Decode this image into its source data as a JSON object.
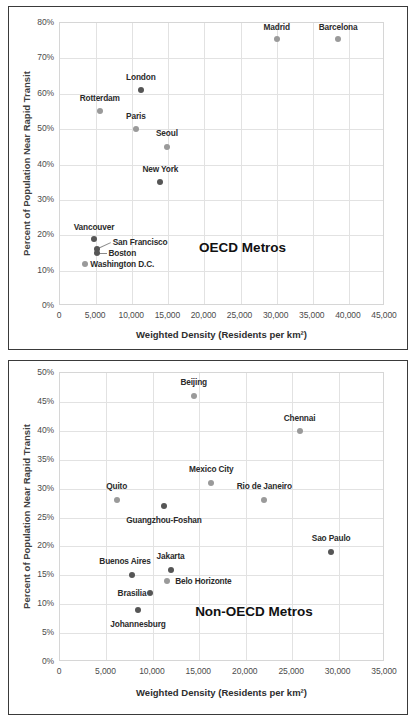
{
  "chart_data": [
    {
      "type": "scatter",
      "title": "OECD Metros",
      "annotation": "OECD Metros",
      "xlabel": "Weighted Density (Residents per km²)",
      "ylabel": "Percent of Population Near Rapid Transit",
      "xlim": [
        0,
        45000
      ],
      "ylim": [
        0,
        0.8
      ],
      "xticks": [
        "0",
        "5,000",
        "10,000",
        "15,000",
        "20,000",
        "25,000",
        "30,000",
        "35,000",
        "40,000",
        "45,000"
      ],
      "xtickvals": [
        0,
        5000,
        10000,
        15000,
        20000,
        25000,
        30000,
        35000,
        40000,
        45000
      ],
      "yticks": [
        "0%",
        "10%",
        "20%",
        "30%",
        "40%",
        "50%",
        "60%",
        "70%",
        "80%"
      ],
      "ytickvals": [
        0,
        10,
        20,
        30,
        40,
        50,
        60,
        70,
        80
      ],
      "grid": true,
      "legend": "none",
      "points": [
        {
          "name": "Madrid",
          "x": 30000,
          "y": 75.5,
          "tone": "light",
          "lx": 30000,
          "ly": 79.0,
          "align": "c"
        },
        {
          "name": "Barcelona",
          "x": 38500,
          "y": 75.5,
          "tone": "light",
          "lx": 38500,
          "ly": 79.0,
          "align": "c"
        },
        {
          "name": "London",
          "x": 11200,
          "y": 61.0,
          "tone": "dark",
          "lx": 11200,
          "ly": 64.8,
          "align": "c"
        },
        {
          "name": "Rotterdam",
          "x": 5500,
          "y": 55.0,
          "tone": "light",
          "lx": 5500,
          "ly": 58.8,
          "align": "c"
        },
        {
          "name": "Paris",
          "x": 10500,
          "y": 50.0,
          "tone": "light",
          "lx": 10500,
          "ly": 53.8,
          "align": "c"
        },
        {
          "name": "Seoul",
          "x": 14800,
          "y": 45.0,
          "tone": "light",
          "lx": 14800,
          "ly": 48.8,
          "align": "c"
        },
        {
          "name": "New York",
          "x": 13900,
          "y": 35.0,
          "tone": "dark",
          "lx": 13900,
          "ly": 38.8,
          "align": "c"
        },
        {
          "name": "Vancouver",
          "x": 4700,
          "y": 19.0,
          "tone": "dark",
          "lx": 4700,
          "ly": 22.2,
          "align": "c"
        },
        {
          "name": "San Francisco",
          "x": 5100,
          "y": 16.0,
          "tone": "dark",
          "lx": 7300,
          "ly": 18.0,
          "align": "l"
        },
        {
          "name": "Boston",
          "x": 5100,
          "y": 15.0,
          "tone": "dark",
          "lx": 6700,
          "ly": 15.0,
          "align": "l"
        },
        {
          "name": "Washington D.C.",
          "x": 3400,
          "y": 12.0,
          "tone": "light",
          "lx": 4200,
          "ly": 12.0,
          "align": "l"
        }
      ],
      "leaders": [
        {
          "x1": 5300,
          "y1": 16.3,
          "x2": 7100,
          "y2": 18.0
        },
        {
          "x1": 5400,
          "y1": 15.0,
          "x2": 6500,
          "y2": 15.0
        }
      ]
    },
    {
      "type": "scatter",
      "title": "Non-OECD Metros",
      "annotation": "Non-OECD Metros",
      "xlabel": "Weighted Density (Residents per km²)",
      "ylabel": "Percent of Population Near Rapid Transit",
      "xlim": [
        0,
        35000
      ],
      "ylim": [
        0,
        0.5
      ],
      "xticks": [
        "0",
        "5,000",
        "10,000",
        "15,000",
        "20,000",
        "25,000",
        "30,000",
        "35,000"
      ],
      "xtickvals": [
        0,
        5000,
        10000,
        15000,
        20000,
        25000,
        30000,
        35000
      ],
      "yticks": [
        "0%",
        "5%",
        "10%",
        "15%",
        "20%",
        "25%",
        "30%",
        "35%",
        "40%",
        "45%",
        "50%"
      ],
      "ytickvals": [
        0,
        5,
        10,
        15,
        20,
        25,
        30,
        35,
        40,
        45,
        50
      ],
      "grid": true,
      "legend": "none",
      "points": [
        {
          "name": "Beijing",
          "x": 14400,
          "y": 46.0,
          "tone": "light",
          "lx": 14400,
          "ly": 48.4,
          "align": "c"
        },
        {
          "name": "Chennai",
          "x": 25800,
          "y": 39.9,
          "tone": "light",
          "lx": 25800,
          "ly": 42.3,
          "align": "c"
        },
        {
          "name": "Mexico City",
          "x": 16300,
          "y": 31.0,
          "tone": "light",
          "lx": 16300,
          "ly": 33.4,
          "align": "c"
        },
        {
          "name": "Rio de Janeiro",
          "x": 22000,
          "y": 28.0,
          "tone": "light",
          "lx": 22000,
          "ly": 30.4,
          "align": "c"
        },
        {
          "name": "Quito",
          "x": 6100,
          "y": 28.0,
          "tone": "light",
          "lx": 6100,
          "ly": 30.4,
          "align": "c"
        },
        {
          "name": "Guangzhou-Foshan",
          "x": 11200,
          "y": 27.0,
          "tone": "dark",
          "lx": 11200,
          "ly": 24.6,
          "align": "c"
        },
        {
          "name": "Sao Paulo",
          "x": 29200,
          "y": 19.0,
          "tone": "dark",
          "lx": 29200,
          "ly": 21.4,
          "align": "c"
        },
        {
          "name": "Jakarta",
          "x": 11900,
          "y": 16.0,
          "tone": "dark",
          "lx": 11900,
          "ly": 18.4,
          "align": "c"
        },
        {
          "name": "Buenos Aires",
          "x": 7700,
          "y": 15.0,
          "tone": "dark",
          "lx": 7000,
          "ly": 17.4,
          "align": "c"
        },
        {
          "name": "Belo Horizonte",
          "x": 11500,
          "y": 14.0,
          "tone": "light",
          "lx": 12400,
          "ly": 14.0,
          "align": "l"
        },
        {
          "name": "Brasilia",
          "x": 9700,
          "y": 12.0,
          "tone": "dark",
          "lx": 9300,
          "ly": 12.0,
          "align": "r"
        },
        {
          "name": "Johannesburg",
          "x": 8400,
          "y": 9.0,
          "tone": "dark",
          "lx": 8400,
          "ly": 6.6,
          "align": "c"
        }
      ],
      "leaders": []
    }
  ]
}
